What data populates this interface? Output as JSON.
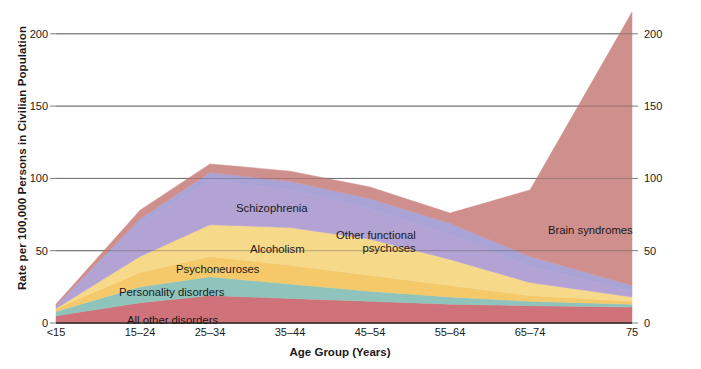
{
  "chart_data": {
    "type": "area",
    "title": "",
    "xlabel": "Age Group (Years)",
    "ylabel": "Rate per 100,000 Persons in Civilian Population",
    "categories": [
      "<15",
      "15–24",
      "25–34",
      "35–44",
      "45–54",
      "55–64",
      "65–74",
      "75"
    ],
    "x_tick_labels": [
      "<15",
      "15–24",
      "25–34",
      "35–44",
      "45–54",
      "55–64",
      "65–74",
      "75"
    ],
    "y_tick_labels_left": [
      "0",
      "50",
      "100",
      "150",
      "200"
    ],
    "y_tick_labels_right": [
      "0",
      "50",
      "100",
      "150",
      "200"
    ],
    "ylim": [
      0,
      215
    ],
    "y_ticks": [
      0,
      50,
      100,
      150,
      200
    ],
    "grid": true,
    "grid_axis": "y",
    "legend": "in-plot band labels",
    "stacked": true,
    "stack_order_bottom_to_top": [
      "All other disorders",
      "Personality disorders",
      "Psychoneuroses",
      "Alcoholism",
      "Schizophrenia",
      "Other functional psychoses",
      "Brain syndromes"
    ],
    "series": [
      {
        "name": "All other disorders",
        "color": "#cf7279",
        "values": [
          5,
          14,
          19,
          17,
          15,
          13,
          12,
          11
        ]
      },
      {
        "name": "Personality disorders",
        "color": "#8fc4bd",
        "values": [
          3,
          11,
          13,
          10,
          7,
          5,
          3,
          2
        ]
      },
      {
        "name": "Psychoneuroses",
        "color": "#f5c96a",
        "values": [
          2,
          10,
          14,
          13,
          11,
          8,
          4,
          2
        ]
      },
      {
        "name": "Alcoholism",
        "color": "#f7d98a",
        "values": [
          0,
          11,
          22,
          26,
          25,
          18,
          9,
          3
        ]
      },
      {
        "name": "Schizophrenia",
        "color": "#b3a2d4",
        "values": [
          2,
          23,
          31,
          26,
          21,
          17,
          11,
          4
        ]
      },
      {
        "name": "Other functional psychoses",
        "color": "#a9a3d6",
        "values": [
          0,
          3,
          5,
          6,
          7,
          8,
          7,
          4
        ]
      },
      {
        "name": "Brain syndromes",
        "color": "#cf8f8c",
        "values": [
          1,
          6,
          6,
          7,
          8,
          7,
          46,
          189
        ]
      }
    ],
    "totals": [
      13,
      78,
      110,
      105,
      94,
      76,
      92,
      215
    ],
    "band_labels": [
      {
        "text": "Schizophrenia",
        "x_px": 236,
        "y_px": 202
      },
      {
        "text": "Alcoholism",
        "x_px": 250,
        "y_px": 243
      },
      {
        "text": "Other functional",
        "text2": "psychoses",
        "x_px": 336,
        "y_px": 229
      },
      {
        "text": "Brain syndromes",
        "x_px": 548,
        "y_px": 224
      },
      {
        "text": "Psychoneuroses",
        "x_px": 176,
        "y_px": 263
      },
      {
        "text": "Personality disorders",
        "x_px": 119,
        "y_px": 286
      },
      {
        "text": "All other disorders",
        "x_px": 127,
        "y_px": 314
      }
    ],
    "colors": {
      "gridline": "#6e6e6e",
      "axis": "#2b2b2b",
      "background": "#ffffff",
      "text": "#1a1a1a"
    }
  }
}
